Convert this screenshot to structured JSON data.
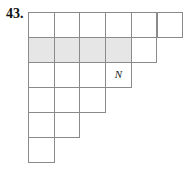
{
  "problem": {
    "number": "43.",
    "grid": {
      "rows": [
        6,
        5,
        4,
        3,
        2,
        1
      ],
      "shaded": [
        [
          1,
          0
        ],
        [
          1,
          1
        ],
        [
          1,
          2
        ],
        [
          1,
          3
        ]
      ],
      "labels": [
        {
          "row": 2,
          "col": 3,
          "text": "N"
        }
      ]
    },
    "colors": {
      "line": "#8a8a8a",
      "shade": "#e6e6e6"
    }
  }
}
